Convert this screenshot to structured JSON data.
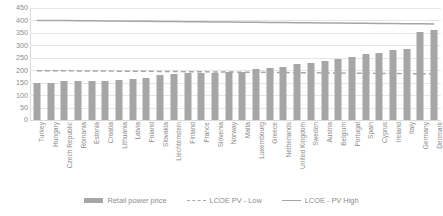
{
  "chart_data": {
    "type": "bar",
    "title": "",
    "subtitle": "",
    "xlabel": "",
    "ylabel": "",
    "ylim": [
      0,
      450
    ],
    "yticks": [
      0,
      50,
      100,
      150,
      200,
      250,
      300,
      350,
      400,
      450
    ],
    "grid": true,
    "legend_position": "bottom",
    "categories": [
      "Turkey",
      "Hungary",
      "Czech Republic",
      "Romania",
      "Estonia",
      "Croatia",
      "Lithuania",
      "Latvia",
      "Poland",
      "Slovakia",
      "Liechtenstein",
      "Finland",
      "France",
      "Slovenia",
      "Norway",
      "Malta",
      "Luxembourg",
      "Greece",
      "Netherlands",
      "United Kingdom",
      "Sweden",
      "Austria",
      "Belgium",
      "Portugal",
      "Spain",
      "Cyprus",
      "Ireland",
      "Italy",
      "Germany",
      "Denmark"
    ],
    "series": [
      {
        "name": "Retail power price",
        "type": "bar",
        "color": "#a6a6a6",
        "values": [
          148,
          148,
          156,
          157,
          158,
          158,
          160,
          164,
          169,
          180,
          183,
          187,
          189,
          188,
          192,
          193,
          204,
          207,
          214,
          225,
          231,
          238,
          246,
          255,
          265,
          269,
          281,
          287,
          355,
          361
        ]
      },
      {
        "name": "LCOE PV - Low",
        "type": "line",
        "style": "dashed",
        "color": "#a6a6a6",
        "values": [
          198,
          198,
          198,
          197,
          197,
          197,
          196,
          196,
          196,
          195,
          195,
          194,
          194,
          193,
          193,
          192,
          192,
          191,
          191,
          190,
          190,
          189,
          189,
          188,
          188,
          187,
          187,
          186,
          186,
          185
        ]
      },
      {
        "name": "LCOE - PV High",
        "type": "line",
        "style": "solid",
        "color": "#a6a6a6",
        "values": [
          400,
          400,
          400,
          399,
          399,
          398,
          398,
          397,
          397,
          396,
          396,
          395,
          395,
          394,
          394,
          393,
          393,
          392,
          392,
          391,
          391,
          390,
          390,
          389,
          389,
          388,
          388,
          387,
          387,
          386
        ]
      }
    ]
  },
  "legend": {
    "items": [
      {
        "label": "Retail power price",
        "marker": "bar-swatch"
      },
      {
        "label": "LCOE PV - Low",
        "marker": "dashed-line-swatch"
      },
      {
        "label": "LCOE - PV High",
        "marker": "solid-line-swatch"
      }
    ]
  },
  "colors": {
    "bar": "#a6a6a6",
    "line": "#a6a6a6",
    "gridline": "#e6e6e6",
    "axis": "#d9d9d9",
    "text": "#8c8c8c"
  }
}
